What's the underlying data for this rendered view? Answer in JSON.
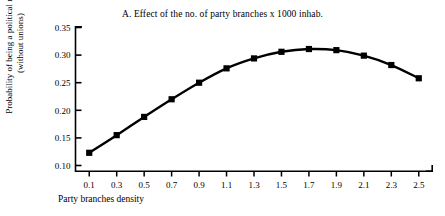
{
  "chart_data": {
    "type": "line",
    "title": "A. Effect of the no. of party branches x 1000 inhab.",
    "xlabel": "Party branches density",
    "ylabel_line1": "Probability of being a political member",
    "ylabel_line2": "(without unions)",
    "x": [
      0.1,
      0.3,
      0.5,
      0.7,
      0.9,
      1.1,
      1.3,
      1.5,
      1.7,
      1.9,
      2.1,
      2.3,
      2.5
    ],
    "values": [
      0.123,
      0.155,
      0.188,
      0.22,
      0.25,
      0.276,
      0.294,
      0.306,
      0.311,
      0.309,
      0.299,
      0.282,
      0.258
    ],
    "series": [
      {
        "name": "Probability of being a political member (without unions)",
        "values": [
          0.123,
          0.155,
          0.188,
          0.22,
          0.25,
          0.276,
          0.294,
          0.306,
          0.311,
          0.309,
          0.299,
          0.282,
          0.258
        ]
      }
    ],
    "xtick_labels": [
      "0.1",
      "0.3",
      "0.5",
      "0.7",
      "0.9",
      "1.1",
      "1.3",
      "1.5",
      "1.7",
      "1.9",
      "2.1",
      "2.3",
      "2.5"
    ],
    "ytick_labels": [
      "0.10",
      "0.15",
      "0.20",
      "0.25",
      "0.30",
      "0.35"
    ],
    "ytick_values": [
      0.1,
      0.15,
      0.2,
      0.25,
      0.3,
      0.35
    ],
    "xlim": [
      0.0,
      2.6
    ],
    "ylim": [
      0.1,
      0.35
    ],
    "grid": false,
    "legend": false,
    "marker": "square",
    "line_color": "#000000",
    "marker_color": "#000000",
    "background_color": "#ffffff"
  }
}
